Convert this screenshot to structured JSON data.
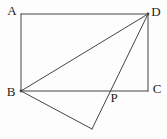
{
  "diagram": {
    "width": 167,
    "height": 139,
    "background_color": "#fdfdfd",
    "line_color": "#454545",
    "label_color": "#1e1e1e",
    "points": {
      "A": {
        "x": 21,
        "y": 14
      },
      "D": {
        "x": 148,
        "y": 14
      },
      "C": {
        "x": 148,
        "y": 91
      },
      "B": {
        "x": 21,
        "y": 91
      },
      "Q": {
        "x": 92,
        "y": 129
      },
      "P": {
        "x": 111,
        "y": 91
      }
    },
    "segments": [
      {
        "name": "segment-AD",
        "from": "A",
        "to": "D"
      },
      {
        "name": "segment-DC",
        "from": "D",
        "to": "C"
      },
      {
        "name": "segment-CB",
        "from": "C",
        "to": "B"
      },
      {
        "name": "segment-BA",
        "from": "B",
        "to": "A"
      },
      {
        "name": "segment-BD",
        "from": "B",
        "to": "D"
      },
      {
        "name": "segment-BQ",
        "from": "B",
        "to": "Q"
      },
      {
        "name": "segment-QD",
        "from": "Q",
        "to": "D"
      }
    ],
    "dots": [
      {
        "name": "vertex-dot-B",
        "at": "B",
        "r": 1.4
      },
      {
        "name": "vertex-dot-D",
        "at": "D",
        "r": 1.4
      }
    ],
    "labels": [
      {
        "text": "A",
        "x": 12,
        "y": 15
      },
      {
        "text": "D",
        "x": 156,
        "y": 16
      },
      {
        "text": "B",
        "x": 11,
        "y": 96
      },
      {
        "text": "C",
        "x": 157,
        "y": 93
      },
      {
        "text": "P",
        "x": 114,
        "y": 102
      }
    ]
  }
}
